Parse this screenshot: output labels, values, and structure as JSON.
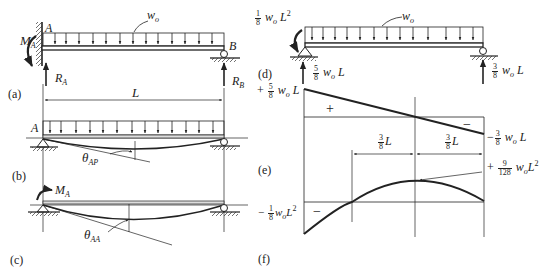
{
  "panels": {
    "a": {
      "tag": "(a)",
      "point_A": "A",
      "point_B": "B",
      "load": "w",
      "load_sub": "o",
      "moment": "M",
      "moment_sub": "A",
      "reaction_A": "R",
      "reaction_A_sub": "A",
      "reaction_B": "R",
      "reaction_B_sub": "B",
      "span": "L"
    },
    "b": {
      "tag": "(b)",
      "point_A": "A",
      "angle": "θ",
      "angle_sub": "AP"
    },
    "c": {
      "tag": "(c)",
      "moment": "M",
      "moment_sub": "A",
      "angle": "θ",
      "angle_sub": "AA"
    },
    "d": {
      "tag": "(d)",
      "moment_num": "1",
      "moment_den": "8",
      "moment_text": "w",
      "moment_sub": "o",
      "moment_tail": "L",
      "moment_exp": "2",
      "load": "w",
      "load_sub": "o",
      "reaction_A_num": "5",
      "reaction_A_den": "8",
      "reaction_A_text": "w",
      "reaction_A_sub": "o",
      "reaction_A_tail": "L",
      "reaction_B_num": "3",
      "reaction_B_den": "8",
      "reaction_B_text": "w",
      "reaction_B_sub": "o",
      "reaction_B_tail": "L"
    },
    "e": {
      "tag": "(e)",
      "top_sign": "+",
      "top_num": "5",
      "top_den": "8",
      "top_text": "w",
      "top_sub": "o",
      "top_tail": "L",
      "region_pos": "+",
      "region_neg": "−",
      "bottom_sign": "−",
      "bottom_num": "3",
      "bottom_den": "8",
      "bottom_text": "w",
      "bottom_sub": "o",
      "bottom_tail": "L",
      "dim_left_num": "3",
      "dim_left_den": "8",
      "dim_left_tail": "L",
      "dim_right_num": "3",
      "dim_right_den": "8",
      "dim_right_tail": "L"
    },
    "f": {
      "tag": "(f)",
      "max_sign": "+",
      "max_num": "9",
      "max_den": "128",
      "max_text": "w",
      "max_sub": "o",
      "max_tail": "L",
      "max_exp": "2",
      "min_sign": "−",
      "min_num": "1",
      "min_den": "8",
      "min_text": "w",
      "min_sub": "o",
      "min_tail": "L",
      "min_exp": "2",
      "region_neg": "−"
    }
  }
}
